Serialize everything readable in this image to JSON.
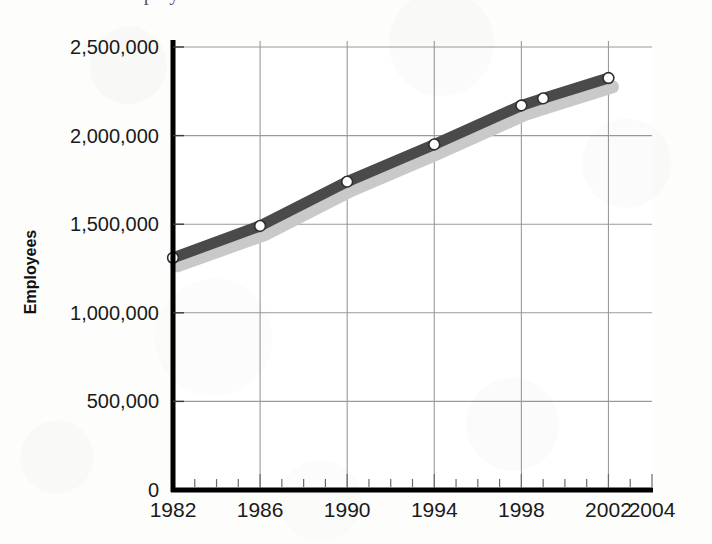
{
  "page": {
    "background_color": "#fdfdfc",
    "partial_title": "Employees"
  },
  "chart_data": {
    "type": "line",
    "title": "",
    "xlabel": "",
    "ylabel": "Employees",
    "x": [
      1982,
      1986,
      1990,
      1994,
      1998,
      1999,
      2002
    ],
    "series": [
      {
        "name": "Employees",
        "color": "#4a4a4a",
        "marker": "white-circle",
        "values": [
          1310000,
          1490000,
          1740000,
          1950000,
          2170000,
          2210000,
          2325000
        ]
      },
      {
        "name": "drop-shadow",
        "color": "#c9c9c9",
        "marker": "none",
        "values": [
          1265000,
          1440000,
          1690000,
          1900000,
          2120000,
          2160000,
          2275000
        ]
      }
    ],
    "xlim": [
      1982,
      2004
    ],
    "ylim": [
      0,
      2500000
    ],
    "xticks": [
      1982,
      1986,
      1990,
      1994,
      1998,
      2002,
      2004
    ],
    "xtick_labels": [
      "1982",
      "1986",
      "1990",
      "1994",
      "1998",
      "2002",
      "2004"
    ],
    "xminor_tick_interval": 1,
    "yticks": [
      0,
      500000,
      1000000,
      1500000,
      2000000,
      2500000
    ],
    "ytick_labels": [
      "0",
      "500,000",
      "1,000,000",
      "1,500,000",
      "2,000,000",
      "2,500,000"
    ],
    "grid": {
      "x": true,
      "y": true,
      "color": "#9a9a9a"
    },
    "legend": {
      "visible": false,
      "position": "none"
    },
    "axis_color": "#000000",
    "axis_line_width": 4
  }
}
